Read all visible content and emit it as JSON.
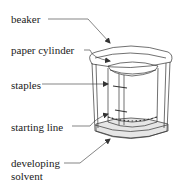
{
  "diagram": {
    "labels": {
      "beaker": "beaker",
      "paper_cylinder": "paper cylinder",
      "staples": "staples",
      "starting_line": "starting line",
      "developing_solvent_line1": "developing",
      "developing_solvent_line2": "solvent"
    },
    "colors": {
      "stroke": "#333333",
      "text": "#222222",
      "solvent_fill": "#e6e6e6",
      "background": "#ffffff"
    }
  }
}
